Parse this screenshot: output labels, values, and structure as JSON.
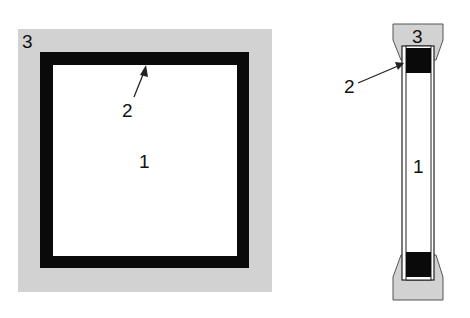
{
  "colors": {
    "body_fill": "#d2d2d2",
    "frame_fill": "#0a0a0a",
    "inner_fill": "#ffffff",
    "line": "#222222"
  },
  "front_view": {
    "labels": {
      "inner_region": "1",
      "frame_edge": "2",
      "outer_body": "3"
    }
  },
  "side_view": {
    "labels": {
      "inner_region": "1",
      "frame_edge": "2",
      "outer_body": "3"
    }
  }
}
